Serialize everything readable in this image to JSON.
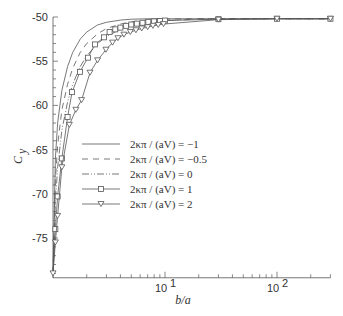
{
  "chart_data": {
    "type": "line",
    "title": "",
    "xlabel": "b/a",
    "ylabel": "C_y",
    "xscale": "log",
    "xlim": [
      1,
      300
    ],
    "ylim": [
      -79.5,
      -50
    ],
    "grid": false,
    "legend_position": "center",
    "x_tick_labels": [
      {
        "value": 10,
        "label": "10",
        "exp": "1"
      },
      {
        "value": 100,
        "label": "10",
        "exp": "2"
      }
    ],
    "y_ticks": [
      -50,
      -55,
      -60,
      -65,
      -70,
      -75
    ],
    "y_tick_labels": [
      "-50",
      "-55",
      "-60",
      "-65",
      "-70",
      "-75"
    ],
    "series": [
      {
        "name": "2κπ / (aV) = -1",
        "style": "solid",
        "marker": "none",
        "x": [
          1.0,
          1.05,
          1.1,
          1.2,
          1.35,
          1.5,
          1.75,
          2.0,
          2.5,
          3.0,
          4.0,
          5.0,
          7.0,
          10,
          20,
          30,
          100,
          300
        ],
        "y": [
          -79.0,
          -66.0,
          -62.0,
          -58.3,
          -55.6,
          -54.0,
          -52.5,
          -51.7,
          -50.9,
          -50.6,
          -50.35,
          -50.25,
          -50.2,
          -50.2,
          -50.2,
          -50.2,
          -50.2,
          -50.2
        ]
      },
      {
        "name": "2κπ / (aV) = -0.5",
        "style": "dashed",
        "marker": "none",
        "x": [
          1.0,
          1.05,
          1.1,
          1.2,
          1.35,
          1.5,
          1.75,
          2.0,
          2.5,
          3.0,
          4.0,
          5.0,
          7.0,
          10,
          20,
          30,
          100,
          300
        ],
        "y": [
          -79.0,
          -68.5,
          -64.5,
          -60.5,
          -57.6,
          -55.8,
          -54.0,
          -53.0,
          -51.9,
          -51.3,
          -50.8,
          -50.55,
          -50.35,
          -50.25,
          -50.2,
          -50.2,
          -50.2,
          -50.2
        ]
      },
      {
        "name": "2κπ / (aV) = 0",
        "style": "dashdotdot",
        "marker": "none",
        "x": [
          1.0,
          1.05,
          1.1,
          1.2,
          1.35,
          1.5,
          1.75,
          2.0,
          2.5,
          3.0,
          4.0,
          5.0,
          7.0,
          10,
          20,
          30,
          100,
          300
        ],
        "y": [
          -79.0,
          -71.0,
          -67.0,
          -62.8,
          -59.6,
          -57.6,
          -55.6,
          -54.4,
          -53.0,
          -52.2,
          -51.4,
          -51.0,
          -50.6,
          -50.4,
          -50.25,
          -50.2,
          -50.2,
          -50.2
        ]
      },
      {
        "name": "2κπ / (aV) = 1",
        "style": "solid",
        "marker": "square",
        "x": [
          1.0,
          1.05,
          1.1,
          1.2,
          1.35,
          1.48,
          1.74,
          2.05,
          2.37,
          2.85,
          3.2,
          3.6,
          4.0,
          4.5,
          5.0,
          5.6,
          6.3,
          7.1,
          8.0,
          9.0,
          10,
          30,
          100,
          300
        ],
        "y": [
          -79.0,
          -74.0,
          -70.3,
          -66.0,
          -61.3,
          -58.5,
          -56.2,
          -54.6,
          -53.1,
          -52.3,
          -51.7,
          -51.4,
          -51.2,
          -51.0,
          -50.85,
          -50.75,
          -50.65,
          -50.55,
          -50.5,
          -50.45,
          -50.4,
          -50.25,
          -50.2,
          -50.2
        ]
      },
      {
        "name": "2κπ / (aV) = 2",
        "style": "solid",
        "marker": "triangle-down",
        "x": [
          1.0,
          1.05,
          1.1,
          1.2,
          1.4,
          1.6,
          1.8,
          2.14,
          2.5,
          2.97,
          3.4,
          3.8,
          4.3,
          4.9,
          5.5,
          6.2,
          7.0,
          7.8,
          8.7,
          9.7,
          30,
          100,
          300
        ],
        "y": [
          -79.0,
          -75.5,
          -72.5,
          -67.0,
          -62.2,
          -60.5,
          -59.4,
          -56.3,
          -54.9,
          -53.7,
          -52.9,
          -52.4,
          -52.0,
          -51.7,
          -51.5,
          -51.3,
          -51.15,
          -51.0,
          -50.9,
          -50.8,
          -50.3,
          -50.2,
          -50.2
        ]
      }
    ]
  },
  "legend": {
    "items": [
      {
        "label": "2κπ / (aV) = −1"
      },
      {
        "label": "2κπ / (aV) = −0.5"
      },
      {
        "label": "2κπ / (aV) = 0"
      },
      {
        "label": "2κπ / (aV) = 1"
      },
      {
        "label": "2κπ / (aV) = 2"
      }
    ]
  },
  "axes": {
    "xlabel": "b/a",
    "ylabel_main": "C",
    "ylabel_sub": "y"
  }
}
